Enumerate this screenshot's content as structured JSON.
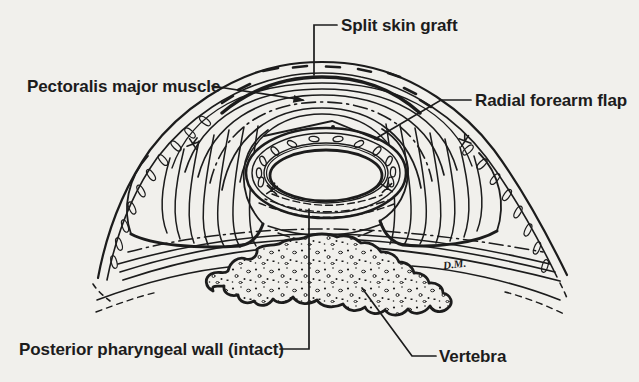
{
  "figure": {
    "type": "medical-line-illustration",
    "labels": {
      "split_skin_graft": "Split skin graft",
      "pectoralis_major_muscle": "Pectoralis major muscle",
      "radial_forearm_flap": "Radial forearm flap",
      "posterior_pharyngeal_wall": "Posterior pharyngeal wall (intact)",
      "vertebra": "Vertebra"
    },
    "signature": "D.M.",
    "colors": {
      "paper": "#f1f0ec",
      "ink": "#1c1c1c"
    }
  }
}
